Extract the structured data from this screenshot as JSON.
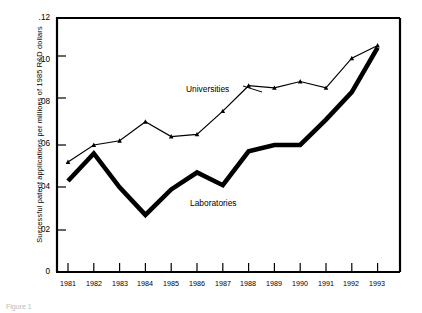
{
  "chart_data": {
    "type": "line",
    "title": "",
    "xlabel": "",
    "ylabel": "Successful patent applications per millions of 1985 R&D dollars",
    "categories": [
      "1981",
      "1982",
      "1983",
      "1984",
      "1985",
      "1986",
      "1987",
      "1988",
      "1989",
      "1990",
      "1991",
      "1992",
      "1993"
    ],
    "xlim": [
      1981,
      1993
    ],
    "ylim": [
      0,
      0.12
    ],
    "ytick_labels": [
      "0",
      ".02",
      ".04",
      ".06",
      ".08",
      ".10",
      ".12"
    ],
    "ytick_values": [
      0,
      0.02,
      0.04,
      0.06,
      0.08,
      0.1,
      0.12
    ],
    "grid": false,
    "legend_position": "inline-annotations",
    "series": [
      {
        "name": "Universities",
        "style": "thin-with-markers",
        "color": "#000000",
        "values": [
          0.052,
          0.06,
          0.062,
          0.071,
          0.064,
          0.065,
          0.076,
          0.088,
          0.087,
          0.09,
          0.087,
          0.101,
          0.107
        ]
      },
      {
        "name": "Laboratories",
        "style": "thick-no-markers",
        "color": "#000000",
        "values": [
          0.043,
          0.056,
          0.04,
          0.027,
          0.039,
          0.047,
          0.041,
          0.057,
          0.06,
          0.06,
          0.072,
          0.085,
          0.106
        ]
      }
    ],
    "annotations": [
      {
        "text": "Universities",
        "x": 1986.0,
        "y": 0.082
      },
      {
        "text": "Laboratories",
        "x": 1986.1,
        "y": 0.034
      }
    ]
  },
  "caption": {
    "text": "Figure 1"
  }
}
